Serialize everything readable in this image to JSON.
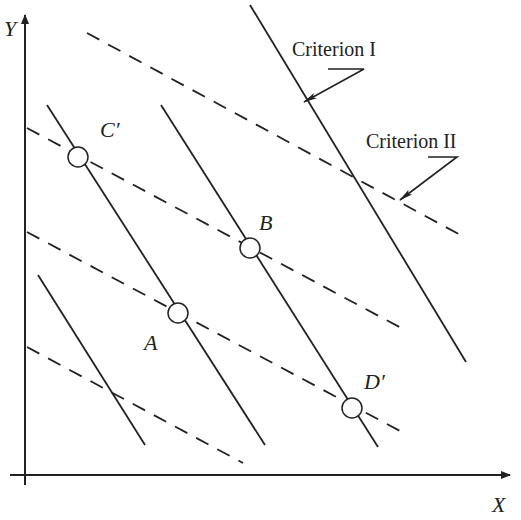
{
  "figure": {
    "axes": {
      "y_label": "Y",
      "x_label": "X",
      "y_axis": {
        "x": 25,
        "y1": 15,
        "y2": 485
      },
      "x_axis": {
        "y": 475,
        "x1": 10,
        "x2": 510
      }
    },
    "colors": {
      "line": "#222222",
      "background": "#ffffff",
      "marker_fill": "#ffffff"
    },
    "criterion_1": {
      "label": "Criterion I",
      "style": "solid",
      "lines": [
        {
          "x1": 38,
          "y1": 275,
          "x2": 145,
          "y2": 445
        },
        {
          "x1": 47,
          "y1": 105,
          "x2": 265,
          "y2": 445
        },
        {
          "x1": 161,
          "y1": 105,
          "x2": 378,
          "y2": 447
        },
        {
          "x1": 250,
          "y1": 5,
          "x2": 466,
          "y2": 362
        }
      ]
    },
    "criterion_2": {
      "label": "Criterion II",
      "style": "dashed",
      "lines": [
        {
          "x1": 87,
          "y1": 33,
          "x2": 466,
          "y2": 238
        },
        {
          "x1": 27,
          "y1": 128,
          "x2": 405,
          "y2": 330
        },
        {
          "x1": 27,
          "y1": 232,
          "x2": 402,
          "y2": 432
        },
        {
          "x1": 27,
          "y1": 347,
          "x2": 243,
          "y2": 463
        }
      ]
    },
    "points": [
      {
        "name": "C′",
        "cx": 78,
        "cy": 157,
        "lx": 100,
        "ly": 137
      },
      {
        "name": "B",
        "cx": 250,
        "cy": 248,
        "lx": 259,
        "ly": 230
      },
      {
        "name": "A",
        "cx": 178,
        "cy": 313,
        "lx": 144,
        "ly": 350
      },
      {
        "name": "D′",
        "cx": 352,
        "cy": 408,
        "lx": 364,
        "ly": 389
      }
    ],
    "annotations": [
      {
        "text": "Criterion I",
        "x": 292,
        "y": 56
      },
      {
        "text": "Criterion II",
        "x": 366,
        "y": 148
      }
    ],
    "caption": ""
  }
}
